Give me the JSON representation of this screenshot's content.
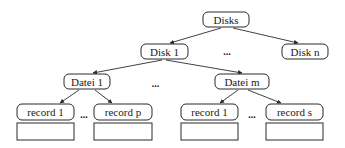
{
  "diagram": {
    "type": "tree",
    "nodes": {
      "root": {
        "label": "Disks"
      },
      "disk1": {
        "label": "Disk 1"
      },
      "diskn": {
        "label": "Disk n"
      },
      "datei1": {
        "label": "Datei 1"
      },
      "dateim": {
        "label": "Datei m"
      },
      "rec1a": {
        "label": "record 1"
      },
      "recp": {
        "label": "record p"
      },
      "rec1b": {
        "label": "record 1"
      },
      "recs": {
        "label": "record s"
      }
    },
    "edges": [
      {
        "from": "Disks",
        "to": "Disk 1"
      },
      {
        "from": "Disks",
        "to": "Disk n"
      },
      {
        "from": "Disk 1",
        "to": "Datei 1"
      },
      {
        "from": "Disk 1",
        "to": "Datei m"
      },
      {
        "from": "Datei 1",
        "to": "record 1"
      },
      {
        "from": "Datei 1",
        "to": "record p"
      },
      {
        "from": "Datei m",
        "to": "record 1"
      },
      {
        "from": "Datei m",
        "to": "record s"
      }
    ],
    "ellipses": {
      "disks_level": "...",
      "dateien_level": "...",
      "records_left": "...",
      "records_right": "..."
    },
    "colors": {
      "stroke": "#2a2a2a",
      "text": "#1a1a1a",
      "background": "#ffffff"
    }
  }
}
